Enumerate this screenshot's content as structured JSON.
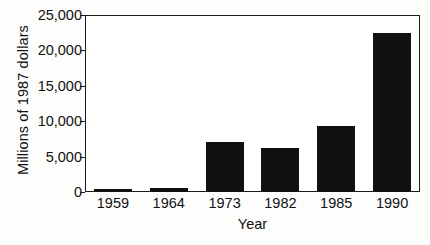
{
  "chart_data": {
    "type": "bar",
    "title": "",
    "subtitle": "",
    "xlabel": "Year",
    "ylabel": "Millions of 1987 dollars",
    "categories": [
      "1959",
      "1964",
      "1973",
      "1982",
      "1985",
      "1990"
    ],
    "values": [
      400,
      600,
      7000,
      6200,
      9300,
      22500
    ],
    "ylim": [
      0,
      25000
    ],
    "yticks": [
      0,
      5000,
      10000,
      15000,
      20000,
      25000
    ],
    "ytick_labels": [
      "0",
      "5,000",
      "10,000",
      "15,000",
      "20,000",
      "25,000"
    ],
    "grid": false,
    "legend": null,
    "bar_color": "#111111",
    "axis_color": "#1b1b1b",
    "background_color": "#fdfdfb"
  }
}
